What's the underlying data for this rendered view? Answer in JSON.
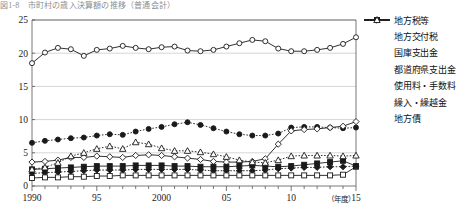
{
  "title": "図1-8　市町村の歳入決算額の推移（普通会計）",
  "axis": {
    "y_ticks": [
      "0",
      "5",
      "10",
      "15",
      "20",
      "25"
    ],
    "y_values": [
      0,
      5,
      10,
      15,
      20,
      25
    ],
    "x_ticks": [
      "1990",
      "95",
      "2000",
      "05",
      "10",
      "15"
    ],
    "x_tick_years": [
      1990,
      1995,
      2000,
      2005,
      2010,
      2015
    ],
    "x_unit_label": "（年度）"
  },
  "legend": [
    {
      "label": "地方税等",
      "marker": "open-circle",
      "line": "solid"
    },
    {
      "label": "地方交付税",
      "marker": "filled-circle",
      "line": "dotted"
    },
    {
      "label": "国庫支出金",
      "marker": "open-diamond",
      "line": "solid"
    },
    {
      "label": "都道府県支出金",
      "marker": "filled-diamond",
      "line": "dotted"
    },
    {
      "label": "使用料・手数料",
      "marker": "open-square",
      "line": "solid"
    },
    {
      "label": "繰入・繰越金",
      "marker": "filled-square",
      "line": "solid"
    },
    {
      "label": "地方債",
      "marker": "open-triangle",
      "line": "dotted"
    }
  ],
  "chart_data": {
    "type": "line",
    "title": "図1-8　市町村の歳入決算額の推移（普通会計）",
    "xlabel": "（年度）",
    "ylabel": "",
    "xlim": [
      1990,
      2015
    ],
    "ylim": [
      0,
      25
    ],
    "grid": true,
    "legend_position": "right",
    "x": [
      1990,
      1991,
      1992,
      1993,
      1994,
      1995,
      1996,
      1997,
      1998,
      1999,
      2000,
      2001,
      2002,
      2003,
      2004,
      2005,
      2006,
      2007,
      2008,
      2009,
      2010,
      2011,
      2012,
      2013,
      2014,
      2015
    ],
    "series": [
      {
        "name": "地方税等",
        "marker": "open-circle",
        "line": "solid",
        "values": [
          18.5,
          20.1,
          20.8,
          20.6,
          19.6,
          20.5,
          20.7,
          21.1,
          20.8,
          20.6,
          20.9,
          21.0,
          20.4,
          20.3,
          20.5,
          21.0,
          21.5,
          22.0,
          21.8,
          20.7,
          20.3,
          20.3,
          20.5,
          20.8,
          21.4,
          22.4
        ]
      },
      {
        "name": "地方交付税",
        "marker": "filled-circle",
        "line": "dotted",
        "values": [
          6.5,
          6.8,
          7.0,
          7.2,
          7.3,
          7.6,
          7.8,
          7.7,
          8.2,
          8.6,
          8.9,
          9.3,
          9.6,
          9.2,
          8.7,
          8.2,
          7.8,
          7.6,
          7.6,
          7.9,
          8.8,
          8.9,
          8.9,
          8.8,
          8.7,
          8.8
        ]
      },
      {
        "name": "国庫支出金",
        "marker": "open-diamond",
        "line": "solid",
        "values": [
          3.6,
          3.7,
          3.9,
          4.3,
          4.3,
          4.5,
          4.4,
          4.3,
          4.6,
          4.7,
          4.6,
          4.4,
          4.2,
          4.0,
          3.7,
          3.6,
          3.6,
          3.7,
          4.1,
          6.3,
          8.3,
          8.5,
          8.6,
          8.8,
          9.0,
          9.7
        ]
      },
      {
        "name": "都道府県支出金",
        "marker": "filled-diamond",
        "line": "dotted",
        "values": [
          1.9,
          2.0,
          2.1,
          2.2,
          2.3,
          2.4,
          2.4,
          2.4,
          2.5,
          2.5,
          2.5,
          2.5,
          2.5,
          2.4,
          2.3,
          2.3,
          2.3,
          2.3,
          2.4,
          2.6,
          2.7,
          2.8,
          2.8,
          2.9,
          2.9,
          3.0
        ]
      },
      {
        "name": "使用料・手数料",
        "marker": "open-square",
        "line": "solid",
        "values": [
          1.2,
          1.3,
          1.3,
          1.4,
          1.4,
          1.5,
          1.5,
          1.6,
          1.6,
          1.6,
          1.6,
          1.6,
          1.6,
          1.6,
          1.6,
          1.6,
          1.6,
          1.6,
          1.6,
          1.6,
          1.6,
          1.6,
          1.6,
          1.6,
          1.7,
          2.9
        ]
      },
      {
        "name": "繰入・繰越金",
        "marker": "filled-square",
        "line": "solid",
        "values": [
          2.5,
          2.6,
          2.7,
          2.8,
          2.9,
          3.0,
          3.0,
          3.0,
          3.1,
          3.1,
          3.1,
          3.0,
          3.0,
          2.9,
          2.9,
          2.9,
          3.0,
          3.1,
          3.0,
          2.9,
          3.0,
          3.2,
          3.4,
          3.6,
          3.8,
          3.0
        ]
      },
      {
        "name": "地方債",
        "marker": "open-triangle",
        "line": "dotted",
        "values": [
          2.5,
          2.8,
          3.5,
          4.5,
          5.0,
          5.6,
          6.0,
          5.6,
          6.6,
          6.3,
          5.7,
          5.3,
          5.3,
          5.1,
          4.8,
          4.4,
          3.9,
          3.6,
          3.5,
          3.9,
          4.5,
          4.6,
          4.6,
          4.6,
          4.5,
          4.6
        ]
      }
    ]
  }
}
